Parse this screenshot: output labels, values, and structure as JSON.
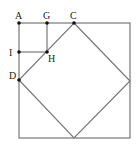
{
  "figure": {
    "type": "geometry-diagram",
    "colors": {
      "line": "#777777",
      "point": "#111111",
      "label": "#222222",
      "background": "#ffffff"
    }
  },
  "points": {
    "A": {
      "label": "A",
      "x": 19,
      "y": 23
    },
    "G": {
      "label": "G",
      "x": 47,
      "y": 23
    },
    "C": {
      "label": "C",
      "x": 74,
      "y": 23
    },
    "I": {
      "label": "I",
      "x": 19,
      "y": 52
    },
    "H": {
      "label": "H",
      "x": 47,
      "y": 52
    },
    "D": {
      "label": "D",
      "x": 19,
      "y": 80
    }
  },
  "labels": {
    "A": "A",
    "G": "G",
    "C": "C",
    "I": "I",
    "H": "H",
    "D": "D"
  }
}
